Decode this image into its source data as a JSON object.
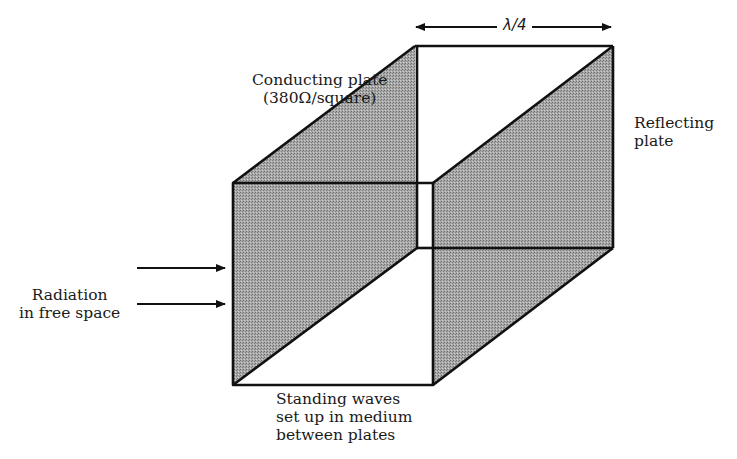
{
  "figure": {
    "type": "Salisbury screen absorber schematic",
    "dimension_label": "λ/4",
    "labels": {
      "conducting_plate": [
        "Conducting plate",
        "(380Ω/square)"
      ],
      "reflecting_plate": [
        "Reflecting",
        "plate"
      ],
      "radiation": [
        "Radiation",
        "in free space"
      ],
      "standing_waves": [
        "Standing waves",
        "set up in medium",
        "between plates"
      ]
    },
    "colors": {
      "plate_fill": "#9a9a9a",
      "edge": "#111111",
      "background": "#ffffff"
    },
    "geometry": {
      "front_face": {
        "x1": 233,
        "y1": 183,
        "x2": 433,
        "y2": 385
      },
      "back_face": {
        "x1": 415,
        "y1": 46,
        "x2": 613,
        "y2": 248
      }
    }
  }
}
